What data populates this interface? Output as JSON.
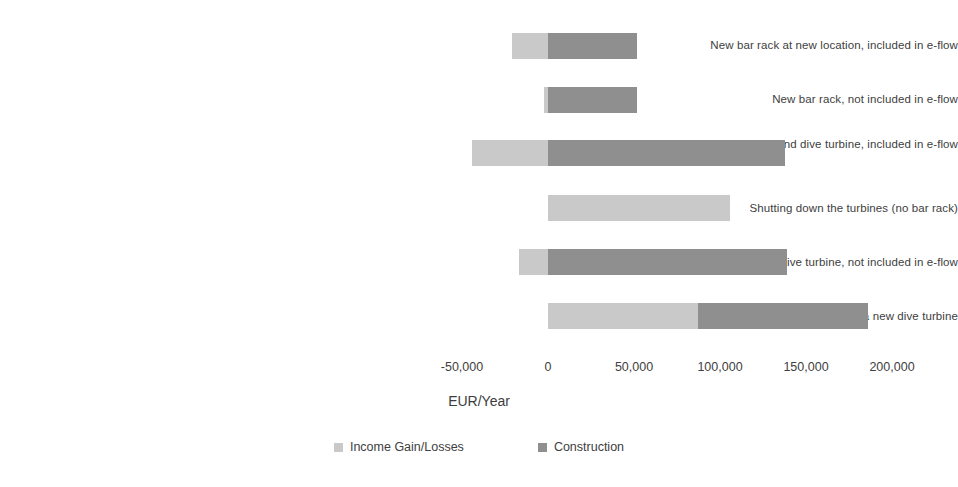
{
  "chart_data": {
    "type": "bar",
    "orientation": "horizontal",
    "stacked": true,
    "title": "",
    "xlabel": "EUR/Year",
    "ylabel": "",
    "xlim": [
      -62000,
      215000
    ],
    "xticks": [
      -50000,
      0,
      50000,
      100000,
      150000,
      200000
    ],
    "xtick_labels": [
      "-50,000",
      "0",
      "50,000",
      "100,000",
      "150,000",
      "200,000"
    ],
    "grid": false,
    "legend_position": "bottom",
    "categories": [
      "New bar rack at new location, included in e-flow",
      "New bar rack, not included in e-flow",
      "New bar rack at new location and dive turbine, included in e-flow",
      "Shutting down the turbines (no bar rack)",
      "New bar rack and dive turbine, not included in e-flow",
      "Shutting down the turbines (no bar rack) and a new dive turbine"
    ],
    "series": [
      {
        "name": "Income Gain/Losses",
        "color": "#c9c9c9",
        "values": [
          -21000,
          -2500,
          -44000,
          106000,
          -17000,
          87000
        ]
      },
      {
        "name": "Construction",
        "color": "#8f8f8f",
        "values": [
          73000,
          54500,
          182000,
          0,
          156000,
          99000
        ]
      }
    ],
    "bar_totals": [
      52000,
      52000,
      138000,
      106000,
      139000,
      186000
    ]
  },
  "axis": {
    "title": "EUR/Year",
    "ticks": [
      {
        "label": "-50,000",
        "value": -50000
      },
      {
        "label": "0",
        "value": 0
      },
      {
        "label": "50,000",
        "value": 50000
      },
      {
        "label": "100,000",
        "value": 100000
      },
      {
        "label": "150,000",
        "value": 150000
      },
      {
        "label": "200,000",
        "value": 200000
      }
    ]
  },
  "legend": {
    "items": [
      {
        "label": "Income Gain/Losses",
        "color": "#c9c9c9"
      },
      {
        "label": "Construction",
        "color": "#8f8f8f"
      }
    ]
  },
  "categories": [
    {
      "label": "New bar rack at new location, included in e-flow"
    },
    {
      "label": "New bar rack, not included in e-flow"
    },
    {
      "label": "New bar rack at new location and dive turbine, included in e-flow"
    },
    {
      "label": "Shutting down the turbines (no bar rack)"
    },
    {
      "label": "New bar rack and dive turbine, not included in e-flow"
    },
    {
      "label": "Shutting down the turbines (no bar rack) and a new dive turbine"
    }
  ]
}
